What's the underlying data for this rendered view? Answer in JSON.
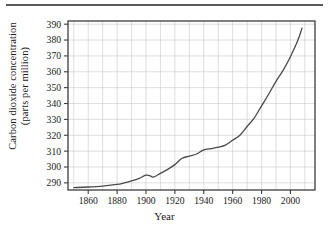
{
  "figure": {
    "has_top_rule": true,
    "background_color": "#ffffff",
    "axis_color": "#3c3c3c",
    "grid_color": "#c8c8c8",
    "line_color": "#4a4a4a"
  },
  "chart_data": {
    "type": "line",
    "title": "",
    "xlabel": "Year",
    "ylabel": "Carbon dioxide concentration (parts per million)",
    "ylabel_line1": "Carbon dioxide concentration",
    "ylabel_line2": "(parts per million)",
    "xlim": [
      1846,
      2017
    ],
    "ylim": [
      285.5,
      392
    ],
    "xticks": [
      1860,
      1880,
      1900,
      1920,
      1940,
      1960,
      1980,
      2000
    ],
    "xticklabels": [
      "1860",
      "1880",
      "1900",
      "1920",
      "1940",
      "1960",
      "1980",
      "2000"
    ],
    "yticks": [
      290,
      300,
      310,
      320,
      330,
      340,
      350,
      360,
      370,
      380,
      390
    ],
    "yticklabels": [
      "290",
      "300",
      "310",
      "320",
      "330",
      "340",
      "350",
      "360",
      "370",
      "380",
      "390"
    ],
    "grid": true,
    "grid_x_step": 10,
    "grid_y_step": 10,
    "legend": null,
    "series": [
      {
        "name": "Atmospheric CO2 concentration",
        "x": [
          1850,
          1860,
          1870,
          1880,
          1885,
          1890,
          1895,
          1900,
          1903,
          1905,
          1910,
          1915,
          1920,
          1925,
          1930,
          1935,
          1940,
          1945,
          1950,
          1955,
          1960,
          1965,
          1970,
          1975,
          1980,
          1985,
          1990,
          1995,
          2000,
          2005,
          2008
        ],
        "y": [
          287.0,
          287.4,
          288.0,
          289.0,
          290.0,
          291.2,
          292.7,
          294.8,
          294.4,
          293.6,
          296.0,
          298.5,
          301.5,
          305.5,
          306.8,
          308.2,
          310.8,
          311.6,
          312.5,
          313.8,
          316.8,
          320.0,
          325.5,
          331.0,
          338.5,
          346.0,
          354.0,
          361.0,
          369.5,
          379.5,
          387.5
        ]
      }
    ]
  },
  "axes_geometry": {
    "plot_left_px": 68,
    "plot_right_px": 315,
    "plot_top_px": 21,
    "plot_bottom_px": 190
  }
}
